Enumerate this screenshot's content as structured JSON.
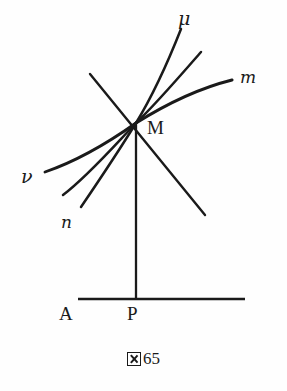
{
  "figure": {
    "caption_kanji": "図",
    "caption_number": "65",
    "caption_full": "図65",
    "ink_color": "#1a1a1a",
    "paper_color": "#fefefe"
  },
  "labels": {
    "mu": "μ",
    "m": "m",
    "M": "M",
    "nu": "ν",
    "n": "n",
    "A": "A",
    "P": "P"
  },
  "geometry": {
    "point_M": {
      "x": 136,
      "y": 123
    },
    "point_P": {
      "x": 136,
      "y": 299
    },
    "baseline": {
      "x1": 78,
      "y1": 299,
      "x2": 245,
      "y2": 299
    },
    "vertical_drop": {
      "x1": 136,
      "y1": 123,
      "x2": 136,
      "y2": 299
    },
    "tangent_line": {
      "x1": 90,
      "y1": 74,
      "x2": 205,
      "y2": 215
    }
  },
  "curves": {
    "upper_right": [
      {
        "name": "mu-curve",
        "label": "μ",
        "end": {
          "x": 181,
          "y": 29
        }
      },
      {
        "name": "middle-upper-curve",
        "label": "",
        "end": {
          "x": 201,
          "y": 52
        }
      },
      {
        "name": "m-curve",
        "label": "m",
        "end": {
          "x": 232,
          "y": 80
        }
      }
    ],
    "lower_left": [
      {
        "name": "nu-curve",
        "label": "ν",
        "end": {
          "x": 45,
          "y": 172
        }
      },
      {
        "name": "middle-lower-curve",
        "label": "",
        "end": {
          "x": 63,
          "y": 195
        }
      },
      {
        "name": "n-curve",
        "label": "n",
        "end": {
          "x": 81,
          "y": 207
        }
      }
    ]
  }
}
